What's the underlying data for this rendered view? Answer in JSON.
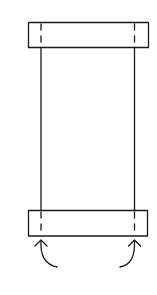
{
  "diagram": {
    "stroke_color": "#1a1a1a",
    "background": "#ffffff",
    "top_bar": {
      "x": 28,
      "y": 22,
      "w": 120,
      "h": 25
    },
    "bottom_bar": {
      "x": 28,
      "y": 210,
      "w": 119,
      "h": 26
    },
    "body": {
      "x_left": 41,
      "x_right": 134,
      "y_top": 47,
      "y_bottom": 210
    },
    "fold_lines": [
      {
        "x": 41
      },
      {
        "x": 134
      }
    ],
    "arrows": [
      {
        "name": "left-fold-arrow",
        "from": [
          57,
          268
        ],
        "to": [
          41,
          240
        ]
      },
      {
        "name": "right-fold-arrow",
        "from": [
          120,
          268
        ],
        "to": [
          134,
          240
        ]
      }
    ]
  }
}
